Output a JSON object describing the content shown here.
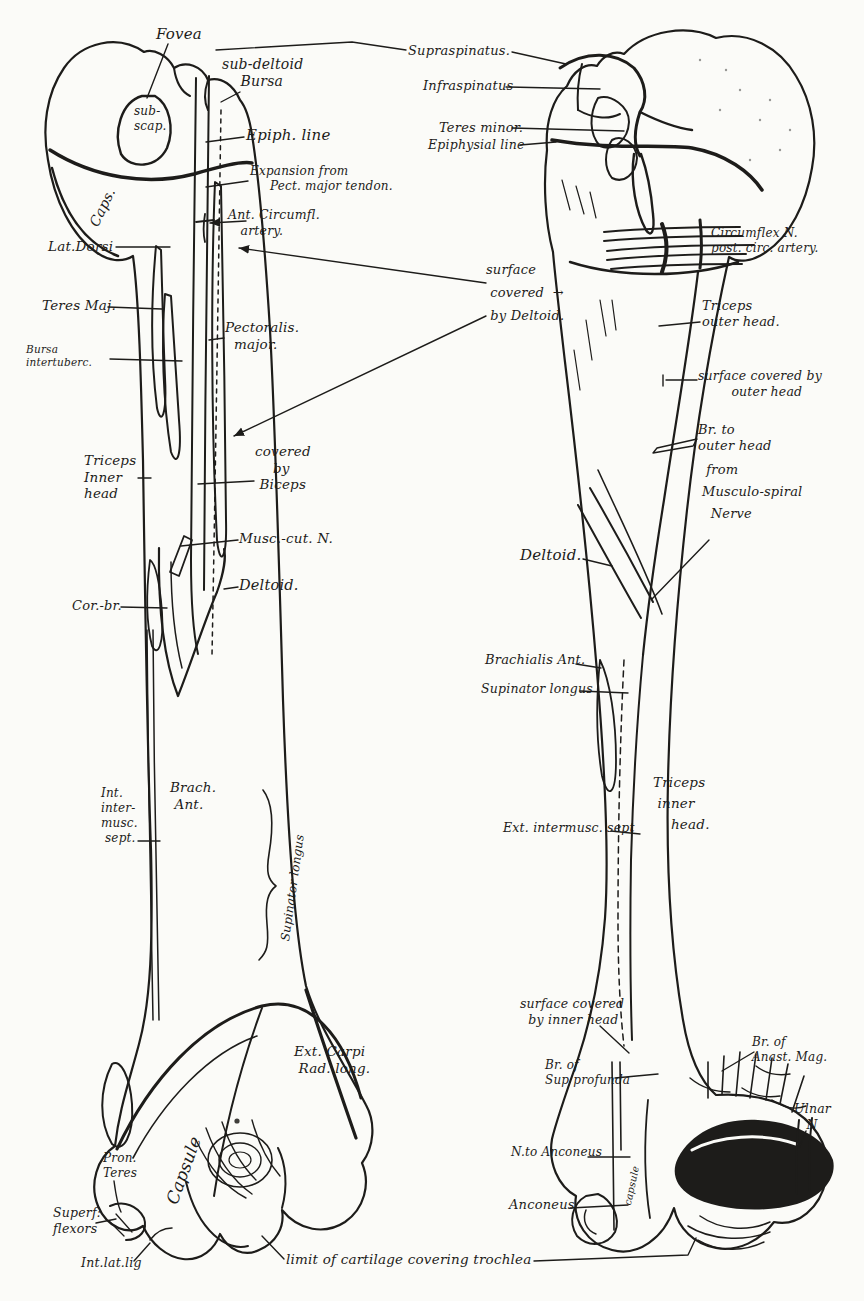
{
  "colors": {
    "paper": "#fbfbf8",
    "ink": "#1d1c1a"
  },
  "labels": [
    {
      "text": "Fovea",
      "x": 156,
      "y": 25,
      "size": 15
    },
    {
      "text": "sub-deltoid\n    Bursa",
      "x": 222,
      "y": 56,
      "size": 14
    },
    {
      "text": "sub-\nscap.",
      "x": 134,
      "y": 104,
      "size": 12
    },
    {
      "text": "Epiph. line",
      "x": 246,
      "y": 126,
      "size": 15
    },
    {
      "text": "Caps.",
      "x": 86,
      "y": 222,
      "size": 14,
      "rotate": -64
    },
    {
      "text": "Expansion from\n     Pect. major tendon.",
      "x": 250,
      "y": 164,
      "size": 12
    },
    {
      "text": "Ant. Circumfl.\n   artery.",
      "x": 228,
      "y": 207,
      "size": 12.5
    },
    {
      "text": "Lat.Dorsi",
      "x": 48,
      "y": 238,
      "size": 13.5
    },
    {
      "text": "Teres Maj.",
      "x": 42,
      "y": 297,
      "size": 13.5
    },
    {
      "text": "Bursa\nintertuberc.",
      "x": 26,
      "y": 343,
      "size": 10.5
    },
    {
      "text": "Pectoralis.\n  major.",
      "x": 225,
      "y": 319,
      "size": 13.5
    },
    {
      "text": "Triceps\nInner\nhead",
      "x": 84,
      "y": 452,
      "size": 13.5
    },
    {
      "text": "covered\n    by\n Biceps",
      "x": 255,
      "y": 443,
      "size": 13.5
    },
    {
      "text": "Musc.-cut. N.",
      "x": 239,
      "y": 530,
      "size": 13.5
    },
    {
      "text": "Deltoid.",
      "x": 239,
      "y": 577,
      "size": 14.5
    },
    {
      "text": "Cor.-br.",
      "x": 72,
      "y": 598,
      "size": 13
    },
    {
      "text": "Int.\ninter-\nmusc.\n sept.",
      "x": 101,
      "y": 786,
      "size": 12
    },
    {
      "text": "Brach.\n Ant.",
      "x": 170,
      "y": 779,
      "size": 13.5
    },
    {
      "text": "Supinator longus",
      "x": 278,
      "y": 940,
      "size": 12,
      "rotate": -82
    },
    {
      "text": "Ext. Carpi\n Rad. long.",
      "x": 294,
      "y": 1043,
      "size": 13.5
    },
    {
      "text": "Capsule",
      "x": 162,
      "y": 1200,
      "size": 17,
      "rotate": -70
    },
    {
      "text": "Pron.\nTeres",
      "x": 103,
      "y": 1151,
      "size": 12
    },
    {
      "text": "Superf:\nflexors",
      "x": 53,
      "y": 1205,
      "size": 12.5
    },
    {
      "text": "Int.lat.lig",
      "x": 81,
      "y": 1255,
      "size": 12.5
    },
    {
      "text": "limit of cartilage covering trochlea",
      "x": 286,
      "y": 1251,
      "size": 13.5
    },
    {
      "text": "Supraspinatus.",
      "x": 408,
      "y": 43,
      "size": 13
    },
    {
      "text": "Infraspinatus",
      "x": 423,
      "y": 78,
      "size": 13
    },
    {
      "text": "Teres minor.",
      "x": 439,
      "y": 120,
      "size": 13
    },
    {
      "text": "Epiphysial line",
      "x": 428,
      "y": 137,
      "size": 12.5
    },
    {
      "text": "surface\n covered  →\n by Deltoid.",
      "x": 486,
      "y": 259,
      "size": 13,
      "lh": 1.75
    },
    {
      "text": "Circumflex N.\npost. circ. artery.",
      "x": 711,
      "y": 226,
      "size": 12
    },
    {
      "text": "Triceps\nouter head.",
      "x": 702,
      "y": 298,
      "size": 13
    },
    {
      "text": "surface covered by\n        outer head",
      "x": 698,
      "y": 368,
      "size": 12.5
    },
    {
      "text": "Br. to\nouter head",
      "x": 698,
      "y": 422,
      "size": 13
    },
    {
      "text": " from\nMusculo-spiral\n  Nerve",
      "x": 702,
      "y": 459,
      "size": 13,
      "lh": 1.7
    },
    {
      "text": "Deltoid.",
      "x": 520,
      "y": 546,
      "size": 15
    },
    {
      "text": "Brachialis Ant.",
      "x": 485,
      "y": 652,
      "size": 13
    },
    {
      "text": "Supinator longus",
      "x": 481,
      "y": 681,
      "size": 12.5
    },
    {
      "text": "Triceps\n inner\n    head.",
      "x": 653,
      "y": 772,
      "size": 13.5,
      "lh": 1.55
    },
    {
      "text": "Ext. intermusc. sept",
      "x": 503,
      "y": 820,
      "size": 12.5
    },
    {
      "text": "surface covered\n  by inner head",
      "x": 520,
      "y": 996,
      "size": 12.5
    },
    {
      "text": "Br. of\nAnast. Mag.",
      "x": 752,
      "y": 1035,
      "size": 12
    },
    {
      "text": "Br. of\nSup profunda",
      "x": 545,
      "y": 1058,
      "size": 12
    },
    {
      "text": "Ulnar\n   N",
      "x": 794,
      "y": 1101,
      "size": 12.5
    },
    {
      "text": "N.to Anconeus",
      "x": 511,
      "y": 1145,
      "size": 12
    },
    {
      "text": "Anconeus",
      "x": 509,
      "y": 1197,
      "size": 13
    },
    {
      "text": "capsule",
      "x": 622,
      "y": 1204,
      "size": 10,
      "rotate": -78
    }
  ]
}
